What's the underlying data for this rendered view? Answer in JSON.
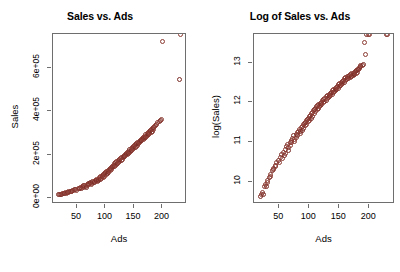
{
  "figure": {
    "background": "#ffffff",
    "point_color": "#8c3b33",
    "frame_color": "#6e6e6e",
    "width": 400,
    "height": 272
  },
  "chart_data": [
    {
      "type": "scatter",
      "id": "sales-vs-ads",
      "title": "Sales vs. Ads",
      "xlabel": "Ads",
      "ylabel": "Sales",
      "xlim": [
        8,
        243
      ],
      "ylim": [
        -30000,
        760000
      ],
      "xticks": [
        50,
        100,
        150,
        200
      ],
      "xticklabels": [
        "50",
        "100",
        "150",
        "200"
      ],
      "yticks": [
        0,
        200000,
        400000,
        600000
      ],
      "yticklabels": [
        "0e+00",
        "2e+05",
        "4e+05",
        "6e+05"
      ],
      "grid": false,
      "legend": "none",
      "marker": "open-circle",
      "x": [
        18,
        20,
        22,
        23,
        25,
        27,
        28,
        30,
        31,
        33,
        35,
        36,
        38,
        40,
        41,
        43,
        44,
        46,
        48,
        50,
        52,
        54,
        55,
        57,
        58,
        60,
        61,
        62,
        64,
        65,
        66,
        68,
        69,
        70,
        71,
        72,
        74,
        75,
        76,
        78,
        79,
        80,
        81,
        82,
        84,
        85,
        86,
        87,
        88,
        89,
        90,
        91,
        92,
        93,
        94,
        95,
        96,
        97,
        98,
        99,
        100,
        101,
        102,
        103,
        104,
        105,
        106,
        107,
        108,
        109,
        110,
        111,
        112,
        113,
        114,
        115,
        116,
        117,
        118,
        119,
        120,
        121,
        122,
        123,
        124,
        125,
        126,
        128,
        129,
        130,
        131,
        132,
        133,
        134,
        135,
        136,
        137,
        138,
        139,
        140,
        141,
        142,
        143,
        144,
        145,
        146,
        147,
        148,
        149,
        150,
        151,
        152,
        153,
        154,
        155,
        156,
        157,
        158,
        159,
        160,
        161,
        162,
        163,
        164,
        165,
        166,
        167,
        168,
        169,
        170,
        171,
        172,
        173,
        174,
        175,
        176,
        177,
        178,
        179,
        180,
        181,
        182,
        183,
        184,
        185,
        186,
        188,
        190,
        192,
        194,
        196,
        198,
        200,
        229,
        231
      ],
      "y": [
        12000,
        14000,
        16000,
        13000,
        18000,
        20000,
        17000,
        22000,
        19000,
        24000,
        26000,
        23000,
        28000,
        30000,
        27000,
        33000,
        31000,
        36000,
        38000,
        35000,
        41000,
        44000,
        40000,
        47000,
        43000,
        50000,
        46000,
        54000,
        57000,
        52000,
        49000,
        60000,
        56000,
        63000,
        59000,
        66000,
        70000,
        64000,
        61000,
        73000,
        68000,
        76000,
        72000,
        79000,
        83000,
        77000,
        74000,
        86000,
        81000,
        89000,
        93000,
        85000,
        96000,
        90000,
        99000,
        103000,
        94000,
        107000,
        100000,
        110000,
        115000,
        105000,
        119000,
        112000,
        123000,
        128000,
        117000,
        132000,
        125000,
        136000,
        141000,
        130000,
        146000,
        138000,
        151000,
        143000,
        156000,
        148000,
        161000,
        154000,
        166000,
        159000,
        171000,
        164000,
        176000,
        169000,
        181000,
        174000,
        186000,
        179000,
        191000,
        184000,
        196000,
        189000,
        201000,
        194000,
        206000,
        199000,
        211000,
        204000,
        216000,
        209000,
        221000,
        214000,
        226000,
        219000,
        231000,
        224000,
        236000,
        229000,
        241000,
        234000,
        246000,
        239000,
        251000,
        244000,
        256000,
        249000,
        261000,
        254000,
        266000,
        259000,
        271000,
        264000,
        276000,
        269000,
        281000,
        274000,
        286000,
        279000,
        291000,
        284000,
        296000,
        289000,
        301000,
        294000,
        306000,
        299000,
        311000,
        304000,
        316000,
        309000,
        321000,
        314000,
        326000,
        331000,
        336000,
        341000,
        347000,
        352000,
        358000,
        364000,
        726000,
        548000
      ]
    },
    {
      "type": "scatter",
      "id": "log-sales-vs-ads",
      "title": "Log of Sales vs. Ads",
      "xlabel": "Ads",
      "ylabel": "log(Sales)",
      "xlim": [
        8,
        243
      ],
      "ylim": [
        9.45,
        13.72
      ],
      "xticks": [
        50,
        100,
        150,
        200
      ],
      "xticklabels": [
        "50",
        "100",
        "150",
        "200"
      ],
      "yticks": [
        10,
        11,
        12,
        13
      ],
      "yticklabels": [
        "10",
        "11",
        "12",
        "13"
      ],
      "grid": false,
      "legend": "none",
      "marker": "open-circle",
      "x": [
        18,
        20,
        22,
        23,
        25,
        27,
        28,
        30,
        31,
        33,
        35,
        36,
        38,
        40,
        41,
        43,
        44,
        46,
        48,
        50,
        52,
        54,
        55,
        57,
        58,
        60,
        61,
        62,
        64,
        65,
        66,
        68,
        69,
        70,
        71,
        72,
        74,
        75,
        76,
        78,
        79,
        80,
        81,
        82,
        84,
        85,
        86,
        87,
        88,
        89,
        90,
        91,
        92,
        93,
        94,
        95,
        96,
        97,
        98,
        99,
        100,
        101,
        102,
        103,
        104,
        105,
        106,
        107,
        108,
        109,
        110,
        111,
        112,
        113,
        114,
        115,
        116,
        117,
        118,
        119,
        120,
        121,
        122,
        123,
        124,
        125,
        126,
        128,
        129,
        130,
        131,
        132,
        133,
        134,
        135,
        136,
        137,
        138,
        139,
        140,
        141,
        142,
        143,
        144,
        145,
        146,
        147,
        148,
        149,
        150,
        151,
        152,
        153,
        154,
        155,
        156,
        157,
        158,
        159,
        160,
        161,
        162,
        163,
        164,
        165,
        166,
        167,
        168,
        169,
        170,
        171,
        172,
        173,
        174,
        175,
        176,
        177,
        178,
        179,
        180,
        181,
        182,
        183,
        184,
        185,
        186,
        188,
        190,
        192,
        194,
        196,
        198,
        200,
        229,
        231
      ],
      "y": [
        9.65,
        9.68,
        9.73,
        9.7,
        9.88,
        9.95,
        9.9,
        10.05,
        9.98,
        10.12,
        10.2,
        10.14,
        10.28,
        10.35,
        10.31,
        10.42,
        10.38,
        10.48,
        10.55,
        10.5,
        10.62,
        10.69,
        10.6,
        10.75,
        10.67,
        10.82,
        10.73,
        10.89,
        10.95,
        10.86,
        10.8,
        11.0,
        10.93,
        11.05,
        10.99,
        11.1,
        11.16,
        11.07,
        11.02,
        11.2,
        11.13,
        11.24,
        11.18,
        11.28,
        11.33,
        11.26,
        11.21,
        11.36,
        11.3,
        11.4,
        11.44,
        11.35,
        11.47,
        11.41,
        11.5,
        11.54,
        11.45,
        11.57,
        11.51,
        11.6,
        11.64,
        11.55,
        11.68,
        11.61,
        11.72,
        11.76,
        11.66,
        11.79,
        11.73,
        11.82,
        11.86,
        11.77,
        11.89,
        11.83,
        11.92,
        11.86,
        11.95,
        11.89,
        11.98,
        11.92,
        12.01,
        11.96,
        12.05,
        11.99,
        12.08,
        12.03,
        12.11,
        12.06,
        12.14,
        12.09,
        12.17,
        12.12,
        12.2,
        12.15,
        12.23,
        12.18,
        12.26,
        12.21,
        12.29,
        12.24,
        12.32,
        12.27,
        12.35,
        12.3,
        12.38,
        12.33,
        12.41,
        12.36,
        12.44,
        12.39,
        12.47,
        12.42,
        12.5,
        12.45,
        12.53,
        12.48,
        12.56,
        12.51,
        12.59,
        12.54,
        12.62,
        12.57,
        12.64,
        12.59,
        12.66,
        12.61,
        12.68,
        12.63,
        12.7,
        12.65,
        12.72,
        12.67,
        12.74,
        12.69,
        12.76,
        12.71,
        12.78,
        12.73,
        12.8,
        12.75,
        12.82,
        12.84,
        12.86,
        12.88,
        12.9,
        12.92,
        12.94,
        12.96,
        13.5,
        13.21
      ]
    }
  ]
}
